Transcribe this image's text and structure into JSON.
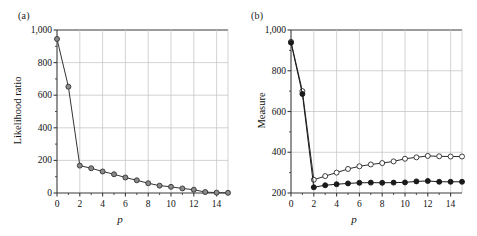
{
  "figure": {
    "background": "#ffffff",
    "axis_color": "#3b3b3b",
    "grid_color": "#c8c8c8"
  },
  "panels": [
    {
      "label": "(a)",
      "ylabel": "Likelihood ratio",
      "xlabel": "p"
    },
    {
      "label": "(b)",
      "ylabel": "Measure",
      "xlabel": "p"
    }
  ],
  "chart_data": [
    {
      "type": "line",
      "title": "(a)",
      "xlabel": "p",
      "ylabel": "Likelihood ratio",
      "xlim": [
        0,
        15
      ],
      "ylim": [
        0,
        1000
      ],
      "xticks": [
        0,
        2,
        4,
        6,
        8,
        10,
        12,
        14
      ],
      "xticklabels": [
        "0",
        "2",
        "4",
        "6",
        "8",
        "10",
        "12",
        "14"
      ],
      "yticks": [
        0,
        200,
        400,
        600,
        800,
        1000
      ],
      "yticklabels": [
        "0",
        "200",
        "400",
        "600",
        "800",
        "1,000"
      ],
      "grid": true,
      "legend": null,
      "marker": "filled-circle",
      "marker_face": "#8a8a8a",
      "marker_edge": "#333333",
      "line_color": "#333333",
      "x": [
        0,
        1,
        2,
        3,
        4,
        5,
        6,
        7,
        8,
        9,
        10,
        11,
        12,
        13,
        14,
        15
      ],
      "values": [
        945,
        652,
        168,
        152,
        132,
        115,
        95,
        78,
        60,
        45,
        38,
        28,
        20,
        6,
        2,
        1
      ]
    },
    {
      "type": "line",
      "title": "(b)",
      "xlabel": "p",
      "ylabel": "Measure",
      "xlim": [
        0,
        15
      ],
      "ylim": [
        200,
        1000
      ],
      "xticks": [
        0,
        2,
        4,
        6,
        8,
        10,
        12,
        14
      ],
      "xticklabels": [
        "0",
        "2",
        "4",
        "6",
        "8",
        "10",
        "12",
        "14"
      ],
      "yticks": [
        200,
        400,
        600,
        800,
        1000
      ],
      "yticklabels": [
        "200",
        "400",
        "600",
        "800",
        "1,000"
      ],
      "grid": true,
      "legend": null,
      "x": [
        0,
        1,
        2,
        3,
        4,
        5,
        6,
        7,
        8,
        9,
        10,
        11,
        12,
        13,
        14,
        15
      ],
      "series": [
        {
          "name": "open-circle-series",
          "marker": "open-circle",
          "marker_face": "#ffffff",
          "marker_edge": "#2b2b2b",
          "line_color": "#2b2b2b",
          "values": [
            942,
            700,
            265,
            283,
            300,
            318,
            331,
            340,
            347,
            355,
            368,
            375,
            382,
            380,
            379,
            379
          ]
        },
        {
          "name": "filled-circle-series",
          "marker": "filled-circle",
          "marker_face": "#1a1a1a",
          "marker_edge": "#1a1a1a",
          "line_color": "#1a1a1a",
          "values": [
            938,
            686,
            228,
            238,
            243,
            247,
            250,
            251,
            250,
            251,
            252,
            257,
            259,
            255,
            255,
            255
          ]
        }
      ]
    }
  ]
}
